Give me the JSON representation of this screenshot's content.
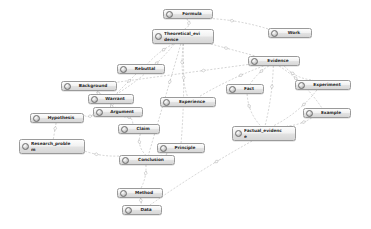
{
  "diagram": {
    "type": "node-link-graph",
    "background_color": "#ffffff",
    "node_border_color": "#9a9a9a",
    "node_fill_color": "#e9e9e9",
    "node_text_color": "#2b2b2b",
    "edge_color": "#a8a8a8",
    "edge_style": "dashed",
    "icon_name": "node-circle-icon"
  },
  "nodes": [
    {
      "id": "formula",
      "label": "Formula",
      "x": 163,
      "y": 9,
      "w": 50,
      "h": 10
    },
    {
      "id": "theoretical",
      "label": "Theoretical_evi\ndence",
      "x": 152,
      "y": 29,
      "w": 62,
      "h": 15,
      "two": true
    },
    {
      "id": "work",
      "label": "Work",
      "x": 268,
      "y": 28,
      "w": 44,
      "h": 10
    },
    {
      "id": "evidence",
      "label": "Evidence",
      "x": 248,
      "y": 56,
      "w": 52,
      "h": 10
    },
    {
      "id": "rebuttal",
      "label": "Rebuttal",
      "x": 117,
      "y": 64,
      "w": 48,
      "h": 10
    },
    {
      "id": "background",
      "label": "Background",
      "x": 61,
      "y": 81,
      "w": 56,
      "h": 10
    },
    {
      "id": "experiment",
      "label": "Experiment",
      "x": 295,
      "y": 80,
      "w": 56,
      "h": 10
    },
    {
      "id": "fact",
      "label": "Fact",
      "x": 226,
      "y": 84,
      "w": 38,
      "h": 10
    },
    {
      "id": "warrant",
      "label": "Warrant",
      "x": 88,
      "y": 94,
      "w": 46,
      "h": 10
    },
    {
      "id": "experience",
      "label": "Experience",
      "x": 160,
      "y": 97,
      "w": 56,
      "h": 10
    },
    {
      "id": "argument",
      "label": "Argument",
      "x": 93,
      "y": 107,
      "w": 50,
      "h": 10
    },
    {
      "id": "example",
      "label": "Example",
      "x": 303,
      "y": 108,
      "w": 48,
      "h": 10
    },
    {
      "id": "hypothesis",
      "label": "Hypothesis",
      "x": 30,
      "y": 113,
      "w": 54,
      "h": 10
    },
    {
      "id": "claim",
      "label": "Claim",
      "x": 118,
      "y": 124,
      "w": 42,
      "h": 10
    },
    {
      "id": "factual_evidence",
      "label": "Factual_evidenc\ne",
      "x": 232,
      "y": 126,
      "w": 64,
      "h": 15,
      "two": true
    },
    {
      "id": "research_problem",
      "label": "Research_proble\nm",
      "x": 19,
      "y": 139,
      "w": 66,
      "h": 15,
      "two": true
    },
    {
      "id": "principle",
      "label": "Principle",
      "x": 157,
      "y": 143,
      "w": 48,
      "h": 10
    },
    {
      "id": "conclusion",
      "label": "Conclusion",
      "x": 119,
      "y": 155,
      "w": 56,
      "h": 10
    },
    {
      "id": "method",
      "label": "Method",
      "x": 117,
      "y": 188,
      "w": 46,
      "h": 10
    },
    {
      "id": "data",
      "label": "Data",
      "x": 122,
      "y": 205,
      "w": 40,
      "h": 10
    }
  ],
  "edges": [
    {
      "from": "formula",
      "to": "theoretical"
    },
    {
      "from": "formula",
      "to": "work"
    },
    {
      "from": "theoretical",
      "to": "evidence"
    },
    {
      "from": "theoretical",
      "to": "rebuttal"
    },
    {
      "from": "theoretical",
      "to": "experience"
    },
    {
      "from": "theoretical",
      "to": "warrant"
    },
    {
      "from": "theoretical",
      "to": "principle"
    },
    {
      "from": "theoretical",
      "to": "conclusion"
    },
    {
      "from": "evidence",
      "to": "fact"
    },
    {
      "from": "evidence",
      "to": "experiment"
    },
    {
      "from": "evidence",
      "to": "example"
    },
    {
      "from": "evidence",
      "to": "factual_evidence"
    },
    {
      "from": "evidence",
      "to": "background"
    },
    {
      "from": "evidence",
      "to": "experience"
    },
    {
      "from": "fact",
      "to": "factual_evidence"
    },
    {
      "from": "experiment",
      "to": "factual_evidence"
    },
    {
      "from": "example",
      "to": "factual_evidence"
    },
    {
      "from": "rebuttal",
      "to": "warrant"
    },
    {
      "from": "background",
      "to": "warrant"
    },
    {
      "from": "warrant",
      "to": "argument"
    },
    {
      "from": "argument",
      "to": "claim"
    },
    {
      "from": "argument",
      "to": "hypothesis"
    },
    {
      "from": "hypothesis",
      "to": "research_problem"
    },
    {
      "from": "research_problem",
      "to": "conclusion"
    },
    {
      "from": "claim",
      "to": "conclusion"
    },
    {
      "from": "principle",
      "to": "conclusion"
    },
    {
      "from": "conclusion",
      "to": "method"
    },
    {
      "from": "method",
      "to": "data"
    },
    {
      "from": "factual_evidence",
      "to": "data"
    }
  ]
}
